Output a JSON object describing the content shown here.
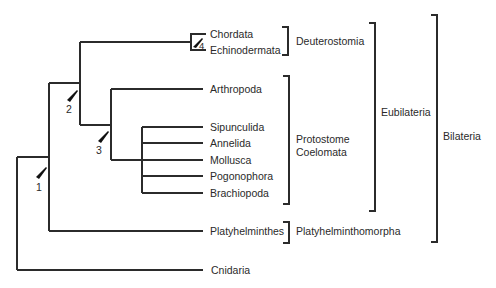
{
  "diagram": {
    "type": "cladogram",
    "colors": {
      "line": "#2b2b2b",
      "text": "#2a2a2a",
      "marker": "#111111"
    },
    "taxa": [
      {
        "id": "chordata",
        "label": "Chordata",
        "y": 34
      },
      {
        "id": "echinodermata",
        "label": "Echinodermata",
        "y": 50
      },
      {
        "id": "arthropoda",
        "label": "Arthropoda",
        "y": 89
      },
      {
        "id": "sipunculida",
        "label": "Sipunculida",
        "y": 127
      },
      {
        "id": "annelida",
        "label": "Annelida",
        "y": 143
      },
      {
        "id": "mollusca",
        "label": "Mollusca",
        "y": 160
      },
      {
        "id": "pogonophora",
        "label": "Pogonophora",
        "y": 176
      },
      {
        "id": "brachiopoda",
        "label": "Brachiopoda",
        "y": 193
      },
      {
        "id": "platyhelminthes",
        "label": "Platyhelminthes",
        "y": 231
      },
      {
        "id": "cnidaria",
        "label": "Cnidaria",
        "y": 270
      }
    ],
    "groups": [
      {
        "id": "deuterostomia",
        "label": "Deuterostomia",
        "lines": [
          "Deuterostomia"
        ]
      },
      {
        "id": "protostome-coelomata",
        "label": "Protostome Coelomata",
        "lines": [
          "Protostome",
          "Coelomata"
        ]
      },
      {
        "id": "platyhelminthomorpha",
        "label": "Platyhelminthomorpha",
        "lines": [
          "Platyhelminthomorpha"
        ]
      },
      {
        "id": "eubilateria",
        "label": "Eubilateria",
        "lines": [
          "Eubilateria"
        ]
      },
      {
        "id": "bilateria",
        "label": "Bilateria",
        "lines": [
          "Bilateria"
        ]
      }
    ],
    "nodes": [
      {
        "id": "node-1",
        "label": "1"
      },
      {
        "id": "node-2",
        "label": "2"
      },
      {
        "id": "node-3",
        "label": "3"
      },
      {
        "id": "node-4",
        "label": "4"
      }
    ]
  }
}
